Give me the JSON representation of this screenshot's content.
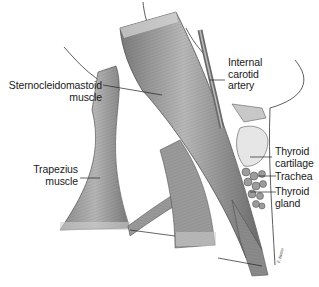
{
  "figure": {
    "labels": [
      {
        "id": "internal-carotid-artery",
        "lines": [
          "Internal",
          "carotid",
          "artery"
        ]
      },
      {
        "id": "sternocleidomastoid-muscle",
        "lines": [
          "Sternocleidomastoid",
          "muscle"
        ]
      },
      {
        "id": "thyroid-cartilage",
        "lines": [
          "Thyroid",
          "cartilage"
        ]
      },
      {
        "id": "trachea",
        "lines": [
          "Trachea"
        ]
      },
      {
        "id": "thyroid-gland",
        "lines": [
          "Thyroid",
          "gland"
        ]
      },
      {
        "id": "trapezius-muscle",
        "lines": [
          "Trapezius",
          "muscle"
        ]
      }
    ],
    "signature": "F. Netter",
    "colors": {
      "muscle_dark": "#6e6e6e",
      "muscle_mid": "#9a9a9a",
      "muscle_light": "#d2d2d2",
      "ink": "#1a1a1a",
      "background": "#ffffff"
    }
  }
}
